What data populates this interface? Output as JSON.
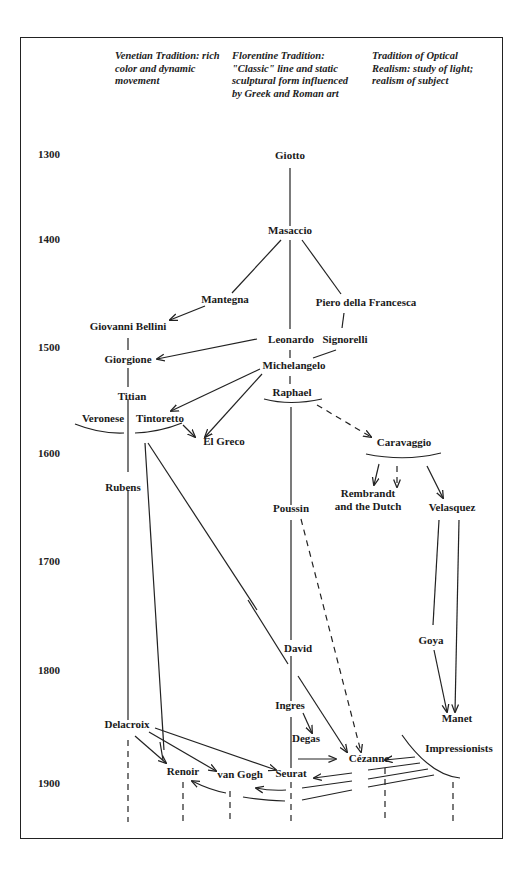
{
  "headers": [
    {
      "text": "Venetian Tradition: rich color and dynamic movement",
      "lines": [
        "Venetian Tradition: rich",
        "color and dynamic",
        "movement"
      ]
    },
    {
      "text": "Florentine Tradition: \"Classic\" line and static sculptural form influenced by Greek and Roman art",
      "lines": [
        "Florentine Tradition:",
        "\"Classic\" line and static",
        "sculptural form influenced",
        "by Greek and Roman art"
      ]
    },
    {
      "text": "Tradition of Optical Realism: study of light; realism of subject",
      "lines": [
        "Tradition of Optical",
        "Realism: study of light;",
        "realism of subject"
      ]
    }
  ],
  "years": [
    "1300",
    "1400",
    "1500",
    "1600",
    "1700",
    "1800",
    "1900"
  ],
  "nodes": {
    "giotto": "Giotto",
    "masaccio": "Masaccio",
    "mantegna": "Mantegna",
    "piero": "Piero della Francesca",
    "bellini": "Giovanni Bellini",
    "leonardo": "Leonardo",
    "signorelli": "Signorelli",
    "giorgione": "Giorgione",
    "michelangelo": "Michelangelo",
    "titian": "Titian",
    "raphael": "Raphael",
    "veronese": "Veronese",
    "tintoretto": "Tintoretto",
    "elgreco": "El Greco",
    "caravaggio": "Caravaggio",
    "rubens": "Rubens",
    "rembrandt1": "Rembrandt",
    "rembrandt2": "and the Dutch",
    "poussin": "Poussin",
    "velasquez": "Velasquez",
    "david": "David",
    "goya": "Goya",
    "ingres": "Ingres",
    "manet": "Manet",
    "delacroix": "Delacroix",
    "degas": "Degas",
    "impressionists": "Impressionists",
    "cezanne": "Cézanne",
    "renoir": "Renoir",
    "vangogh": "van Gogh",
    "seurat": "Seurat"
  }
}
